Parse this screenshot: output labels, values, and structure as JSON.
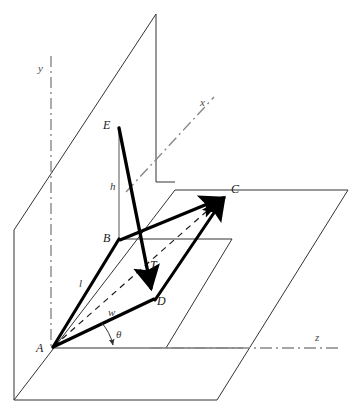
{
  "figure": {
    "type": "geometry-diagram",
    "title": ""
  },
  "axes": {
    "y": {
      "label": "y",
      "x": 38,
      "y": 62,
      "style": "dash-dot"
    },
    "x": {
      "label": "x",
      "x": 200,
      "y": 96,
      "style": "dash-dot"
    },
    "z": {
      "label": "z",
      "x": 315,
      "y": 331,
      "style": "dash-dot"
    }
  },
  "points": [
    {
      "name": "A",
      "label": "A",
      "px": 52,
      "py": 348,
      "label_x": 36,
      "label_y": 341
    },
    {
      "name": "B",
      "label": "B",
      "px": 119,
      "py": 239,
      "label_x": 103,
      "label_y": 231
    },
    {
      "name": "C",
      "label": "C",
      "px": 228,
      "py": 194,
      "label_x": 231,
      "label_y": 182
    },
    {
      "name": "D",
      "label": "D",
      "px": 154,
      "py": 299,
      "label_x": 157,
      "label_y": 294
    },
    {
      "name": "E",
      "label": "E",
      "px": 119,
      "py": 127,
      "label_x": 103,
      "label_y": 118
    }
  ],
  "dimensions": [
    {
      "name": "height",
      "label": "h",
      "label_x": 110,
      "label_y": 180
    },
    {
      "name": "length",
      "label": "l",
      "label_x": 79,
      "label_y": 277
    },
    {
      "name": "width",
      "label": "w",
      "label_x": 108,
      "label_y": 306
    },
    {
      "name": "angle",
      "label": "θ",
      "label_x": 116,
      "label_y": 328
    }
  ],
  "vectors": [
    {
      "name": "T",
      "label": "T",
      "from": "E",
      "to": "D",
      "label_x": 150,
      "label_y": 258,
      "arrow": true
    },
    {
      "name": "AB",
      "label": "",
      "from": "A",
      "to": "B",
      "arrow": false
    },
    {
      "name": "AD",
      "label": "",
      "from": "A",
      "to": "D",
      "arrow": false
    },
    {
      "name": "BC",
      "label": "",
      "from": "B",
      "to": "C",
      "arrow": true
    },
    {
      "name": "DC",
      "label": "",
      "from": "D",
      "to": "C",
      "arrow": true
    }
  ],
  "planes": {
    "vertical_plane": "quadrilateral backdrop plane containing the y axis",
    "ground_plane": "large horizontal parallelogram containing the z axis",
    "inner_plane": "small horizontal parallelogram footprint under B"
  },
  "colors": {
    "line": "#333333",
    "bold_line": "#000000",
    "dash_axis": "#808080",
    "dashed_diagonal": "#1a1a1a",
    "background": "#ffffff"
  }
}
